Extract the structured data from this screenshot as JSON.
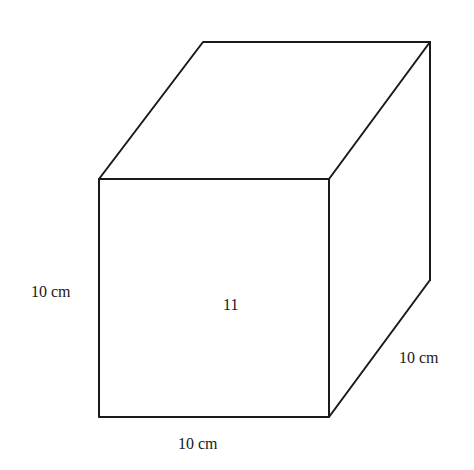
{
  "diagram": {
    "type": "cube-perspective",
    "stroke_color": "#1a1a1a",
    "background": "#ffffff",
    "vertices": {
      "front_top_left": [
        99,
        179
      ],
      "front_top_right": [
        329,
        179
      ],
      "front_bottom_left": [
        99,
        417
      ],
      "front_bottom_right": [
        329,
        417
      ],
      "back_top_left": [
        203,
        42
      ],
      "back_top_right": [
        430,
        42
      ],
      "back_bottom_right": [
        430,
        280
      ]
    },
    "labels": {
      "height": "10 cm",
      "width": "10 cm",
      "depth": "10 cm",
      "face_number": "11"
    }
  }
}
